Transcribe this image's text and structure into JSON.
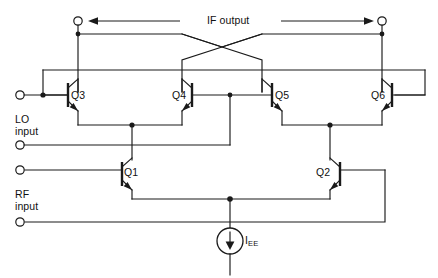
{
  "diagram": {
    "labels": {
      "if_output": "IF output",
      "lo_input": "LO\ninput",
      "rf_input": "RF\ninput",
      "current_source_i": "I",
      "current_source_sub": "EE"
    },
    "transistors": [
      {
        "name": "Q1"
      },
      {
        "name": "Q2"
      },
      {
        "name": "Q3"
      },
      {
        "name": "Q4"
      },
      {
        "name": "Q5"
      },
      {
        "name": "Q6"
      }
    ],
    "colors": {
      "wire": "#1a1a1a",
      "background": "#ffffff"
    }
  }
}
